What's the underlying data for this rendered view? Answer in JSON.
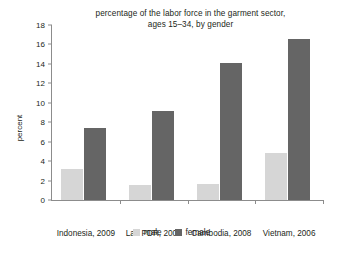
{
  "chart_data": {
    "type": "bar",
    "title": "percentage of the labor force in the garment sector, ages 15–34, by gender",
    "title_lines": [
      "percentage of the labor force in the garment sector,",
      "ages 15–34, by gender"
    ],
    "xlabel": "",
    "ylabel": "percent",
    "ylim": [
      0,
      18
    ],
    "ytick_step": 2,
    "yticks": [
      0,
      2,
      4,
      6,
      8,
      10,
      12,
      14,
      16,
      18
    ],
    "ytick_labels": [
      "0",
      "2",
      "4",
      "6",
      "8",
      "10",
      "12",
      "14",
      "16",
      "18"
    ],
    "grid": false,
    "legend_position": "bottom-center",
    "categories": [
      "Indonesia, 2009",
      "Lao PDR, 2008",
      "Cambodia, 2008",
      "Vietnam, 2006"
    ],
    "series": [
      {
        "name": "male",
        "color": "#d6d6d6",
        "values": [
          3.2,
          1.5,
          1.6,
          4.8
        ]
      },
      {
        "name": "female",
        "color": "#656565",
        "values": [
          7.4,
          9.2,
          14.1,
          16.6
        ]
      }
    ]
  },
  "legend": {
    "items": [
      {
        "label": "male",
        "color": "#d6d6d6"
      },
      {
        "label": "female",
        "color": "#656565"
      }
    ]
  },
  "colors": {
    "male": "#d6d6d6",
    "female": "#656565",
    "axis": "#8c8c8c",
    "text": "#231f20",
    "background": "#ffffff"
  }
}
